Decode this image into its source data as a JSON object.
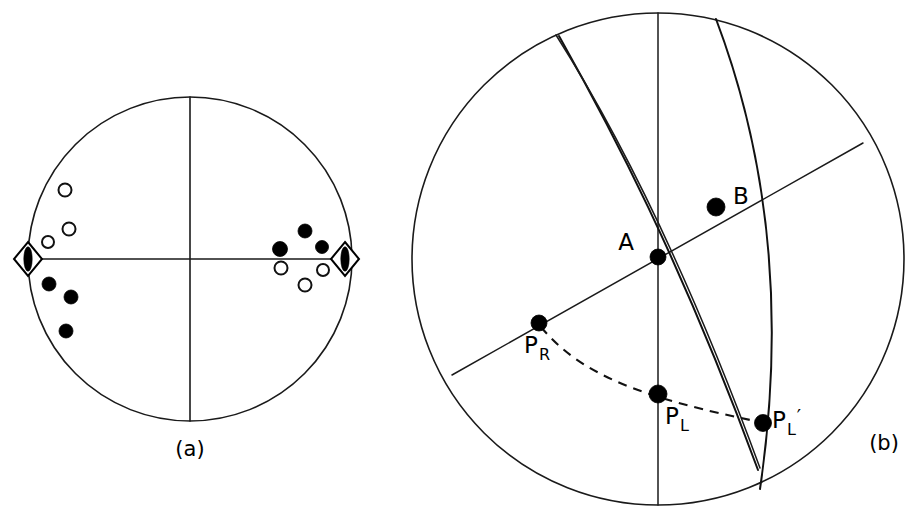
{
  "figure": {
    "background_color": "#ffffff",
    "line_color": "#1a1a1a",
    "marker_fill_color": "#000000",
    "marker_open_color": "#ffffff"
  },
  "panel_a": {
    "caption": "(a)",
    "center": {
      "x": 190,
      "y": 259
    },
    "radius": 162,
    "description": "Equal-area lower-hemisphere projection with vertical and horizontal reference lines, compressional and dilatational first-motion symbols, and P/T axis diamonds.",
    "reference_lines": [
      {
        "name": "vertical-diameter",
        "x1": 190,
        "y1": 97,
        "x2": 190,
        "y2": 421
      },
      {
        "name": "horizontal-diameter",
        "x1": 28,
        "y1": 259,
        "x2": 352,
        "y2": 259
      }
    ],
    "markers": [
      {
        "id": "a-open-1",
        "type": "open-circle",
        "x": 65,
        "y": 190,
        "r": 6.5
      },
      {
        "id": "a-open-2",
        "type": "open-circle",
        "x": 69,
        "y": 229,
        "r": 6.5
      },
      {
        "id": "a-open-3",
        "type": "open-circle",
        "x": 48,
        "y": 242,
        "r": 6.0
      },
      {
        "id": "a-filled-1",
        "type": "filled-circle",
        "x": 49,
        "y": 284,
        "r": 7.0
      },
      {
        "id": "a-filled-2",
        "type": "filled-circle",
        "x": 71,
        "y": 297,
        "r": 7.0
      },
      {
        "id": "a-filled-3",
        "type": "filled-circle",
        "x": 66,
        "y": 331,
        "r": 7.0
      },
      {
        "id": "a-filled-4",
        "type": "filled-circle",
        "x": 305,
        "y": 231,
        "r": 7.0
      },
      {
        "id": "a-filled-5",
        "type": "filled-circle",
        "x": 280,
        "y": 249,
        "r": 7.5
      },
      {
        "id": "a-filled-6",
        "type": "filled-circle",
        "x": 322,
        "y": 247,
        "r": 6.5
      },
      {
        "id": "a-open-4",
        "type": "open-circle",
        "x": 281,
        "y": 268,
        "r": 6.5
      },
      {
        "id": "a-open-5",
        "type": "open-circle",
        "x": 323,
        "y": 270,
        "r": 6.0
      },
      {
        "id": "a-open-6",
        "type": "open-circle",
        "x": 305,
        "y": 285,
        "r": 6.5
      },
      {
        "id": "a-diamond-left",
        "type": "diamond",
        "x": 28,
        "y": 259,
        "rx": 14,
        "ry": 17
      },
      {
        "id": "a-diamond-right",
        "type": "diamond",
        "x": 345,
        "y": 259,
        "rx": 14,
        "ry": 17
      }
    ],
    "marker_counts": {
      "filled_circles": 6,
      "open_circles": 6,
      "diamonds": 2
    }
  },
  "panel_b": {
    "caption": "(b)",
    "caption_position": {
      "x": 884,
      "y": 450
    },
    "center": {
      "x": 658,
      "y": 259
    },
    "radius": 246,
    "description": "Stereonet construction showing two nodal great circles, a straight diameter through A, and a dashed small-circle arc linking P-R, P-L and P-L-prime.",
    "curves": [
      {
        "name": "vertical-diameter",
        "style": "thin",
        "path": "M 658 13 L 658 505"
      },
      {
        "name": "straight-diameter-through-A",
        "style": "thin",
        "path": "M 452 375 L 863 143"
      },
      {
        "name": "nodal-great-circle-1",
        "style": "bold",
        "path": "M 559 36 C 609 125, 680 258, 758 470"
      },
      {
        "name": "nodal-great-circle-2",
        "style": "bold",
        "path": "M 716 19 C 758 130, 790 285, 760 489"
      },
      {
        "name": "reference-arc-upper-left",
        "style": "thin",
        "path": "M 556 35 C 610 120, 680 250, 760 468"
      }
    ],
    "dashed_arc": {
      "name": "dashed-small-circle",
      "path": "M 541 327 C 580 374, 640 398, 765 423"
    },
    "points": [
      {
        "label": "A",
        "x": 658,
        "y": 257,
        "r": 8.0,
        "label_x": 634,
        "label_y": 250,
        "label_anchor": "end"
      },
      {
        "label": "B",
        "x": 716,
        "y": 207,
        "r": 9.0,
        "label_x": 733,
        "label_y": 204,
        "label_anchor": "start"
      },
      {
        "label": "P",
        "subscript": "R",
        "x": 539,
        "y": 323,
        "r": 8.0,
        "label_x": 524,
        "label_y": 353,
        "label_anchor": "start"
      },
      {
        "label": "P",
        "subscript": "L",
        "x": 658,
        "y": 394,
        "r": 9.0,
        "label_x": 665,
        "label_y": 424,
        "label_anchor": "start"
      },
      {
        "label": "P",
        "subscript": "L",
        "prime": "′",
        "x": 763,
        "y": 423,
        "r": 8.5,
        "label_x": 772,
        "label_y": 428,
        "label_anchor": "start"
      }
    ]
  }
}
